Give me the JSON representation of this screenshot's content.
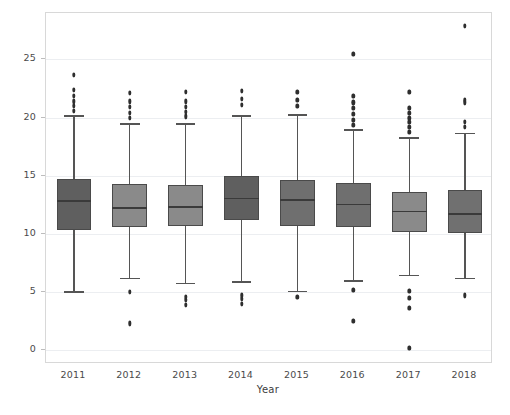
{
  "chart_data": {
    "type": "box",
    "title": "",
    "xlabel": "Year",
    "ylabel": "Birth Rates",
    "categories": [
      "2011",
      "2012",
      "2013",
      "2014",
      "2015",
      "2016",
      "2017",
      "2018"
    ],
    "xtick_labels": [
      "2011",
      "2012",
      "2013",
      "2014",
      "2015",
      "2016",
      "2017",
      "2018"
    ],
    "ytick_labels": [
      "0",
      "5",
      "10",
      "15",
      "20",
      "25"
    ],
    "ytick_values": [
      0,
      5,
      10,
      15,
      20,
      25
    ],
    "ylim": [
      -1.2,
      29.0
    ],
    "grid": true,
    "legend": null,
    "box_fill_colors": [
      "#5f5f5f",
      "#8a8a8a",
      "#8a8a8a",
      "#5f5f5f",
      "#6f6f6f",
      "#6f6f6f",
      "#8a8a8a",
      "#707070"
    ],
    "box_edge_color": "#4a4a4a",
    "median_color": "#3a3a3a",
    "whisker_color": "#555555",
    "flier_color": "#2e2e2e",
    "grid_color": "#eceef1",
    "frame_color": "#d8d8d8",
    "boxes": [
      {
        "category": "2011",
        "whisker_low": 5.05,
        "q1": 10.3,
        "median": 12.9,
        "q3": 14.7,
        "whisker_high": 20.2,
        "fliers": [
          20.6,
          21.0,
          21.4,
          21.9,
          22.4,
          23.7
        ]
      },
      {
        "category": "2012",
        "whisker_low": 6.2,
        "q1": 10.6,
        "median": 12.3,
        "q3": 14.3,
        "whisker_high": 19.5,
        "fliers": [
          2.3,
          5.0,
          20.0,
          20.4,
          20.9,
          21.4,
          22.1
        ]
      },
      {
        "category": "2013",
        "whisker_low": 5.8,
        "q1": 10.7,
        "median": 12.4,
        "q3": 14.2,
        "whisker_high": 19.5,
        "fliers": [
          3.9,
          4.3,
          4.6,
          20.1,
          20.5,
          20.9,
          21.4,
          22.2
        ]
      },
      {
        "category": "2014",
        "whisker_low": 5.9,
        "q1": 11.2,
        "median": 13.1,
        "q3": 15.0,
        "whisker_high": 20.2,
        "fliers": [
          4.0,
          4.4,
          4.7,
          21.1,
          21.6,
          22.3
        ]
      },
      {
        "category": "2015",
        "whisker_low": 5.1,
        "q1": 10.7,
        "median": 13.0,
        "q3": 14.6,
        "whisker_high": 20.3,
        "fliers": [
          4.6,
          21.0,
          21.5,
          22.2
        ]
      },
      {
        "category": "2016",
        "whisker_low": 6.0,
        "q1": 10.6,
        "median": 12.6,
        "q3": 14.4,
        "whisker_high": 19.0,
        "fliers": [
          2.5,
          5.2,
          19.4,
          19.8,
          20.3,
          20.8,
          21.3,
          21.9,
          25.5
        ]
      },
      {
        "category": "2017",
        "whisker_low": 6.5,
        "q1": 10.2,
        "median": 12.0,
        "q3": 13.6,
        "whisker_high": 18.3,
        "fliers": [
          0.2,
          3.6,
          4.5,
          5.1,
          18.8,
          19.2,
          19.6,
          20.0,
          20.4,
          20.8,
          22.2
        ]
      },
      {
        "category": "2018",
        "whisker_low": 6.2,
        "q1": 10.1,
        "median": 11.8,
        "q3": 13.8,
        "whisker_high": 18.7,
        "fliers": [
          4.7,
          19.2,
          19.6,
          21.3,
          21.5,
          27.9
        ]
      }
    ]
  },
  "caption": {
    "text": ""
  }
}
